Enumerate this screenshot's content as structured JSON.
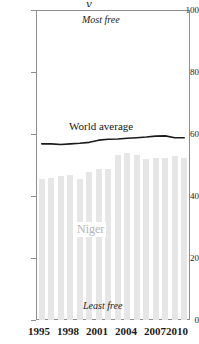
{
  "chart_data": {
    "type": "bar",
    "title": "",
    "xlabel": "",
    "ylabel": "",
    "ylim": [
      0,
      100
    ],
    "yticks": [
      0,
      20,
      40,
      60,
      80,
      100
    ],
    "ytick_labels": [
      "0",
      "20",
      "40",
      "60",
      "80",
      "100"
    ],
    "grid": false,
    "legend": "none",
    "categories": [
      1995,
      1996,
      1997,
      1998,
      1999,
      2000,
      2001,
      2002,
      2003,
      2004,
      2005,
      2006,
      2007,
      2008,
      2009,
      2010
    ],
    "xtick_labels": [
      "1995",
      "1998",
      "2001",
      "2004",
      "2007",
      "2010"
    ],
    "xtick_values": [
      1995,
      1998,
      2001,
      2004,
      2007,
      2010
    ],
    "series": [
      {
        "name": "Niger",
        "type": "bar",
        "color": "#e6e6e6",
        "values": [
          45.5,
          46.0,
          46.5,
          47.0,
          45.5,
          48.0,
          49.0,
          49.0,
          53.5,
          54.0,
          53.5,
          52.0,
          52.5,
          52.5,
          53.0,
          52.5
        ]
      },
      {
        "name": "World average",
        "type": "line",
        "color": "#1a1a1a",
        "values": [
          57.0,
          57.0,
          56.8,
          57.0,
          57.2,
          57.5,
          58.2,
          58.5,
          58.6,
          58.8,
          59.0,
          59.2,
          59.5,
          59.6,
          59.0,
          59.0
        ]
      }
    ],
    "annotations": [
      {
        "name": "most-free",
        "text": "Most free",
        "position": "top"
      },
      {
        "name": "least-free",
        "text": "Least free",
        "position": "bottom"
      },
      {
        "name": "world-average",
        "text": "World average",
        "position": "line"
      },
      {
        "name": "niger",
        "text": "Niger",
        "position": "bars"
      }
    ]
  },
  "axis": {
    "y_labels": [
      "100",
      "80",
      "60",
      "40",
      "20",
      "0"
    ],
    "x_labels": [
      "1995",
      "1998",
      "2001",
      "2004",
      "2007",
      "2010"
    ]
  },
  "labels": {
    "most_free": "Most free",
    "least_free": "Least free",
    "world_average": "World average",
    "niger": "Niger"
  },
  "colors": {
    "bar": "#e6e6e6",
    "line": "#1a1a1a",
    "frame": "#8d8d8d",
    "text": "#1a1a1a",
    "niger_label": "#b4b4b4"
  },
  "title_fragment": "y"
}
